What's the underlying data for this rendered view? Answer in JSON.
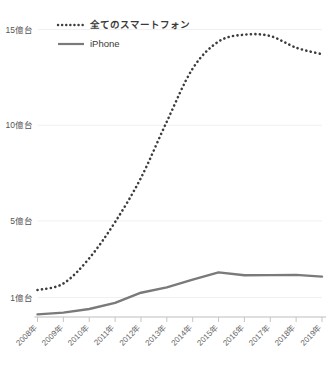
{
  "chart_data": {
    "type": "line",
    "title": "",
    "xlabel": "",
    "ylabel": "",
    "grid": true,
    "legend_position": "top-left",
    "x": [
      "2008年",
      "2009年",
      "2010年",
      "2011年",
      "2012年",
      "2013年",
      "2014年",
      "2015年",
      "2016年",
      "2017年",
      "2018年",
      "2019年"
    ],
    "xtick_labels": [
      "2008年",
      "2009年",
      "2010年",
      "2011年",
      "2012年",
      "2013年",
      "2014年",
      "2015年",
      "2016年",
      "2017年",
      "2018年",
      "2019年"
    ],
    "ytick_labels": [
      "15億台",
      "10億台",
      "5億台",
      "1億台"
    ],
    "ytick_values": [
      15,
      10,
      5,
      1
    ],
    "yunit": "億台",
    "ylim": [
      0,
      15.6
    ],
    "series": [
      {
        "name": "全てのスマートフォン",
        "style": "dotted",
        "color": "#3d3d3d",
        "values": [
          1.39,
          1.73,
          3.05,
          4.94,
          7.25,
          10.19,
          12.96,
          14.37,
          14.73,
          14.66,
          14.05,
          13.71
        ]
      },
      {
        "name": "iPhone",
        "style": "solid",
        "color": "#7a7a7a",
        "values": [
          0.12,
          0.21,
          0.4,
          0.72,
          1.25,
          1.53,
          1.93,
          2.31,
          2.16,
          2.17,
          2.18,
          2.09
        ]
      }
    ],
    "legend": [
      {
        "label": "全てのスマートフォン",
        "style": "dotted",
        "color": "#3d3d3d"
      },
      {
        "label": "iPhone",
        "style": "solid",
        "color": "#7a7a7a"
      }
    ]
  },
  "colors": {
    "background": "#ffffff",
    "grid": "#f0f0f0",
    "axis": "#bdbdbd",
    "smartphone_series": "#3d3d3d",
    "iphone_series": "#7a7a7a",
    "axis_text": "#555555"
  }
}
